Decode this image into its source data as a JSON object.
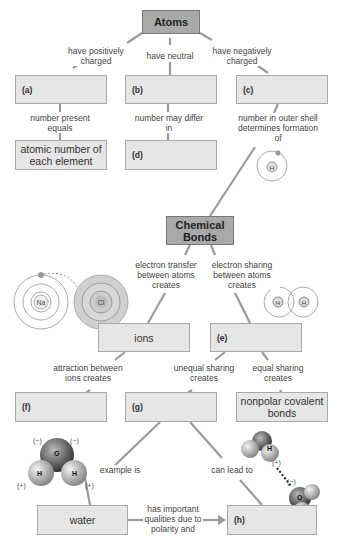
{
  "concept_map": {
    "nodes": {
      "atoms": "Atoms",
      "a": "(a)",
      "b": "(b)",
      "c": "(c)",
      "atomic_number": "atomic number of each element",
      "d": "(d)",
      "chemical_bonds": "Chemical Bonds",
      "ions": "ions",
      "e": "(e)",
      "f": "(f)",
      "g": "(g)",
      "nonpolar": "nonpolar covalent bonds",
      "water": "water",
      "h": "(h)"
    },
    "links": {
      "pos_charged": "have positively charged",
      "neutral": "have neutral",
      "neg_charged": "have negatively charged",
      "number_present": "number present equals",
      "number_may": "number may differ in",
      "outer_shell": "number in outer shell determines formation of",
      "electron_transfer": "electron transfer between atoms creates",
      "electron_sharing": "electron sharing between atoms creates",
      "attraction": "attraction between ions creates",
      "unequal": "unequal sharing creates",
      "equal": "equal sharing creates",
      "example_is": "example is",
      "can_lead": "can lead to",
      "has_important": "has important qualities due to polarity and"
    },
    "illustrations": {
      "na": "Na",
      "cl": "Cl",
      "h": "H",
      "o": "O",
      "neg": "(−)",
      "pos": "(+)"
    }
  }
}
